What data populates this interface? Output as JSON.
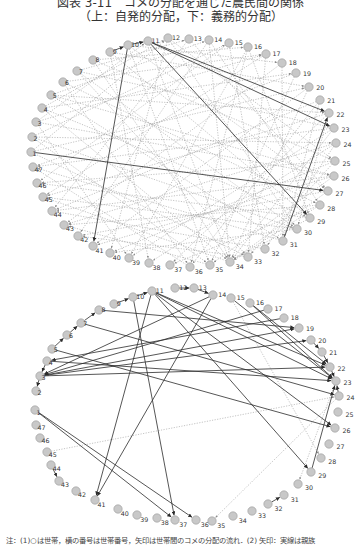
{
  "figure": {
    "title": "図表 3-11　コメの分配を通じた農民間の関係",
    "subtitle": "（上：自発的分配，下：義務的分配）",
    "note": "注：(1)○は世帯，横の番号は世帯番号，矢印は世帯間のコメの分配の流れ．(2) 矢印：実線は親族"
  },
  "colors": {
    "node_fill": "#c8c8c8",
    "node_stroke": "#9a9a9a",
    "solid_edge": "#2b2b2b",
    "dotted_edge": "#9c9c9c",
    "label": "#333333"
  },
  "diagrams": [
    {
      "name": "voluntary-distribution",
      "label": "上：自発的分配",
      "nodes": {
        "1": [
          31,
          152
        ],
        "2": [
          32,
          137
        ],
        "3": [
          36,
          122
        ],
        "4": [
          42,
          108
        ],
        "5": [
          51,
          95
        ],
        "6": [
          63,
          82
        ],
        "7": [
          77,
          71
        ],
        "8": [
          93,
          60
        ],
        "9": [
          110,
          52
        ],
        "10": [
          128,
          45
        ],
        "11": [
          148,
          41
        ],
        "12": [
          168,
          38
        ],
        "13": [
          189,
          39
        ],
        "14": [
          209,
          40
        ],
        "15": [
          229,
          43
        ],
        "16": [
          248,
          47
        ],
        "17": [
          266,
          54
        ],
        "18": [
          282,
          63
        ],
        "19": [
          296,
          73
        ],
        "20": [
          309,
          87
        ],
        "21": [
          320,
          100
        ],
        "22": [
          329,
          113
        ],
        "23": [
          334,
          128
        ],
        "24": [
          336,
          143
        ],
        "25": [
          335,
          161
        ],
        "26": [
          334,
          176
        ],
        "27": [
          328,
          191
        ],
        "28": [
          320,
          205
        ],
        "29": [
          310,
          218
        ],
        "30": [
          297,
          229
        ],
        "31": [
          283,
          241
        ],
        "32": [
          265,
          249
        ],
        "33": [
          248,
          257
        ],
        "34": [
          230,
          262
        ],
        "35": [
          210,
          265
        ],
        "36": [
          190,
          267
        ],
        "37": [
          170,
          265
        ],
        "38": [
          149,
          263
        ],
        "39": [
          129,
          258
        ],
        "40": [
          110,
          253
        ],
        "41": [
          93,
          246
        ],
        "42": [
          78,
          236
        ],
        "43": [
          64,
          225
        ],
        "44": [
          52,
          211
        ],
        "45": [
          43,
          197
        ],
        "46": [
          37,
          183
        ],
        "47": [
          33,
          167
        ]
      },
      "solid_edges": [
        [
          "11",
          "22"
        ],
        [
          "11",
          "23"
        ],
        [
          "11",
          "29"
        ],
        [
          "10",
          "41"
        ],
        [
          "1",
          "27"
        ],
        [
          "31",
          "22"
        ],
        [
          "9",
          "10"
        ],
        [
          "10",
          "11"
        ]
      ],
      "dotted_edges": [
        [
          "1",
          "12"
        ],
        [
          "1",
          "20"
        ],
        [
          "1",
          "33"
        ],
        [
          "2",
          "15"
        ],
        [
          "2",
          "24"
        ],
        [
          "2",
          "35"
        ],
        [
          "3",
          "11"
        ],
        [
          "3",
          "26"
        ],
        [
          "3",
          "39"
        ],
        [
          "4",
          "19"
        ],
        [
          "4",
          "29"
        ],
        [
          "4",
          "34"
        ],
        [
          "5",
          "14"
        ],
        [
          "5",
          "22"
        ],
        [
          "5",
          "31"
        ],
        [
          "6",
          "17"
        ],
        [
          "6",
          "28"
        ],
        [
          "6",
          "36"
        ],
        [
          "7",
          "13"
        ],
        [
          "7",
          "23"
        ],
        [
          "7",
          "30"
        ],
        [
          "8",
          "16"
        ],
        [
          "8",
          "25"
        ],
        [
          "8",
          "34"
        ],
        [
          "9",
          "20"
        ],
        [
          "9",
          "29"
        ],
        [
          "9",
          "38"
        ],
        [
          "10",
          "18"
        ],
        [
          "10",
          "27"
        ],
        [
          "10",
          "35"
        ],
        [
          "12",
          "30"
        ],
        [
          "12",
          "40"
        ],
        [
          "13",
          "27"
        ],
        [
          "13",
          "44"
        ],
        [
          "14",
          "34"
        ],
        [
          "14",
          "42"
        ],
        [
          "15",
          "32"
        ],
        [
          "15",
          "46"
        ],
        [
          "16",
          "29"
        ],
        [
          "16",
          "39"
        ],
        [
          "17",
          "33"
        ],
        [
          "17",
          "45"
        ],
        [
          "18",
          "31"
        ],
        [
          "18",
          "43"
        ],
        [
          "19",
          "35"
        ],
        [
          "19",
          "47"
        ],
        [
          "20",
          "34"
        ],
        [
          "20",
          "41"
        ],
        [
          "21",
          "36"
        ],
        [
          "21",
          "44"
        ],
        [
          "22",
          "37"
        ],
        [
          "22",
          "45"
        ],
        [
          "23",
          "39"
        ],
        [
          "23",
          "47"
        ],
        [
          "24",
          "38"
        ],
        [
          "24",
          "43"
        ],
        [
          "25",
          "40"
        ],
        [
          "25",
          "46"
        ],
        [
          "26",
          "41"
        ],
        [
          "26",
          "44"
        ],
        [
          "27",
          "42"
        ],
        [
          "28",
          "43"
        ],
        [
          "28",
          "37"
        ],
        [
          "29",
          "46"
        ],
        [
          "30",
          "45"
        ],
        [
          "30",
          "40"
        ],
        [
          "31",
          "47"
        ],
        [
          "32",
          "44"
        ],
        [
          "33",
          "42"
        ],
        [
          "34",
          "45"
        ],
        [
          "35",
          "43"
        ],
        [
          "36",
          "47"
        ],
        [
          "2",
          "30"
        ],
        [
          "5",
          "26"
        ],
        [
          "7",
          "33"
        ],
        [
          "11",
          "34"
        ],
        [
          "12",
          "25"
        ],
        [
          "14",
          "28"
        ],
        [
          "16",
          "36"
        ],
        [
          "21",
          "31"
        ],
        [
          "22",
          "30"
        ],
        [
          "23",
          "34"
        ],
        [
          "24",
          "32"
        ],
        [
          "25",
          "33"
        ],
        [
          "26",
          "35"
        ],
        [
          "27",
          "34"
        ],
        [
          "28",
          "34"
        ],
        [
          "29",
          "34"
        ],
        [
          "3",
          "17"
        ],
        [
          "4",
          "12"
        ]
      ]
    },
    {
      "name": "obligatory-distribution",
      "label": "下：義務的分配",
      "nodes": {
        "1": [
          35,
          410
        ],
        "2": [
          36,
          391
        ],
        "3": [
          40,
          376
        ],
        "4": [
          47,
          361
        ],
        "5": [
          52,
          349
        ],
        "6": [
          67,
          335
        ],
        "7": [
          81,
          323
        ],
        "8": [
          99,
          310
        ],
        "9": [
          114,
          304
        ],
        "10": [
          133,
          297
        ],
        "11": [
          152,
          291
        ],
        "12": [
          175,
          288
        ],
        "13": [
          194,
          288
        ],
        "14": [
          213,
          295
        ],
        "15": [
          231,
          298
        ],
        "16": [
          250,
          303
        ],
        "17": [
          268,
          309
        ],
        "18": [
          284,
          318
        ],
        "19": [
          299,
          328
        ],
        "20": [
          311,
          340
        ],
        "21": [
          322,
          352
        ],
        "22": [
          330,
          367
        ],
        "23": [
          336,
          381
        ],
        "24": [
          339,
          396
        ],
        "25": [
          338,
          412
        ],
        "26": [
          335,
          428
        ],
        "27": [
          329,
          444
        ],
        "28": [
          321,
          458
        ],
        "29": [
          311,
          472
        ],
        "30": [
          298,
          484
        ],
        "31": [
          284,
          495
        ],
        "32": [
          268,
          504
        ],
        "33": [
          252,
          511
        ],
        "34": [
          233,
          516
        ],
        "35": [
          212,
          521
        ],
        "36": [
          196,
          520
        ],
        "37": [
          175,
          520
        ],
        "38": [
          157,
          518
        ],
        "39": [
          137,
          515
        ],
        "40": [
          118,
          509
        ],
        "41": [
          95,
          500
        ],
        "42": [
          76,
          491
        ],
        "43": [
          59,
          481
        ],
        "44": [
          51,
          465
        ],
        "45": [
          47,
          452
        ],
        "46": [
          40,
          438
        ],
        "47": [
          36,
          425
        ]
      },
      "solid_edges": [
        [
          "11",
          "22"
        ],
        [
          "11",
          "23"
        ],
        [
          "11",
          "26"
        ],
        [
          "11",
          "29"
        ],
        [
          "11",
          "41"
        ],
        [
          "10",
          "37"
        ],
        [
          "14",
          "41"
        ],
        [
          "14",
          "3"
        ],
        [
          "15",
          "23"
        ],
        [
          "16",
          "22"
        ],
        [
          "16",
          "23"
        ],
        [
          "17",
          "3"
        ],
        [
          "18",
          "4"
        ],
        [
          "8",
          "19"
        ],
        [
          "7",
          "24"
        ],
        [
          "5",
          "26"
        ],
        [
          "3",
          "22"
        ],
        [
          "3",
          "20"
        ],
        [
          "3",
          "19"
        ],
        [
          "4",
          "23"
        ],
        [
          "20",
          "21"
        ],
        [
          "22",
          "23"
        ],
        [
          "24",
          "23"
        ],
        [
          "29",
          "23"
        ],
        [
          "1",
          "37"
        ],
        [
          "1",
          "36"
        ],
        [
          "3",
          "2"
        ],
        [
          "4",
          "3"
        ],
        [
          "5",
          "6"
        ],
        [
          "6",
          "7"
        ],
        [
          "7",
          "8"
        ],
        [
          "10",
          "11"
        ],
        [
          "12",
          "13"
        ],
        [
          "13",
          "14"
        ],
        [
          "44",
          "43"
        ],
        [
          "32",
          "31"
        ],
        [
          "9",
          "10"
        ],
        [
          "21",
          "22"
        ]
      ],
      "dotted_edges": [
        [
          "45",
          "24"
        ],
        [
          "23",
          "30"
        ],
        [
          "24",
          "35"
        ],
        [
          "15",
          "28"
        ]
      ]
    }
  ]
}
